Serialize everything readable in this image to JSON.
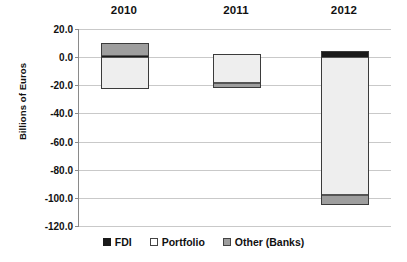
{
  "chart_data": {
    "type": "bar",
    "title": "",
    "xlabel": "",
    "ylabel": "Billions of Euros",
    "categories": [
      "2010",
      "2011",
      "2012"
    ],
    "ylim": [
      -120.0,
      20.0
    ],
    "ytick_labels": [
      "20.0",
      "0.0",
      "-20.0",
      "-40.0",
      "-60.0",
      "-80.0",
      "-100.0",
      "-120.0"
    ],
    "ytick_values": [
      20.0,
      0.0,
      -20.0,
      -40.0,
      -60.0,
      -80.0,
      -100.0,
      -120.0
    ],
    "grid": true,
    "stacked": true,
    "legend_position": "bottom",
    "series": [
      {
        "name": "FDI",
        "color": "#1a1a1a",
        "values": [
          0.6,
          0.0,
          4.3
        ]
      },
      {
        "name": "Portfolio",
        "color": "#eeeeee",
        "values": [
          -23.4,
          -18.7,
          -102.1
        ]
      },
      {
        "name": "Other (Banks)",
        "color": "#9e9e9e",
        "values": [
          9.1,
          -3.3,
          -7.2
        ]
      }
    ],
    "bars": [
      {
        "category": "2010",
        "segments": [
          {
            "series": "Other (Banks)",
            "from": 0.6,
            "to": 9.7
          },
          {
            "series": "FDI",
            "from": 0.0,
            "to": 0.6
          },
          {
            "series": "Portfolio",
            "from": -22.8,
            "to": 0.0
          }
        ]
      },
      {
        "category": "2011",
        "segments": [
          {
            "series": "Portfolio",
            "from": -18.7,
            "to": 2.2
          },
          {
            "series": "Other (Banks)",
            "from": -22.0,
            "to": -18.7
          }
        ]
      },
      {
        "category": "2012",
        "segments": [
          {
            "series": "FDI",
            "from": 0.0,
            "to": 4.3
          },
          {
            "series": "Portfolio",
            "from": -97.8,
            "to": 0.0
          },
          {
            "series": "Other (Banks)",
            "from": -105.0,
            "to": -97.8
          }
        ]
      }
    ],
    "legend": [
      {
        "label": "FDI",
        "swatch": "filled-black"
      },
      {
        "label": "Portfolio",
        "swatch": "white"
      },
      {
        "label": "Other (Banks)",
        "swatch": "gray"
      }
    ]
  },
  "layout": {
    "plot": {
      "left": 78,
      "top": 29,
      "width": 312,
      "height": 197
    },
    "bar_x": [
      100,
      212,
      320
    ],
    "bar_width": 48,
    "year_label_x": [
      100,
      212,
      320
    ]
  }
}
